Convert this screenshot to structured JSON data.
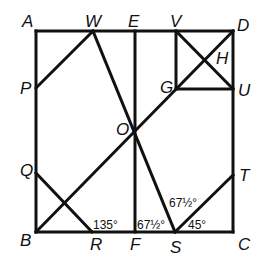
{
  "diagram": {
    "points": {
      "A": {
        "label": "A",
        "x": 36,
        "y": 31
      },
      "B": {
        "label": "B",
        "x": 36,
        "y": 232
      },
      "C": {
        "label": "C",
        "x": 233,
        "y": 232
      },
      "D": {
        "label": "D",
        "x": 233,
        "y": 31
      },
      "W": {
        "label": "W",
        "x": 93,
        "y": 31
      },
      "E": {
        "label": "E",
        "x": 135,
        "y": 31
      },
      "V": {
        "label": "V",
        "x": 176,
        "y": 31
      },
      "P": {
        "label": "P",
        "x": 36,
        "y": 88
      },
      "Q": {
        "label": "Q",
        "x": 36,
        "y": 173
      },
      "O": {
        "label": "O",
        "x": 135,
        "y": 128
      },
      "G": {
        "label": "G",
        "x": 176,
        "y": 89
      },
      "U": {
        "label": "U",
        "x": 233,
        "y": 89
      },
      "H": {
        "label": "H",
        "x": 204,
        "y": 60
      },
      "T": {
        "label": "T",
        "x": 233,
        "y": 175
      },
      "R": {
        "label": "R",
        "x": 92,
        "y": 232
      },
      "F": {
        "label": "F",
        "x": 135,
        "y": 232
      },
      "S": {
        "label": "S",
        "x": 175,
        "y": 232
      }
    },
    "segments": [
      [
        "A",
        "D"
      ],
      [
        "D",
        "C"
      ],
      [
        "C",
        "B"
      ],
      [
        "B",
        "A"
      ],
      [
        "P",
        "W"
      ],
      [
        "W",
        "S"
      ],
      [
        "E",
        "F"
      ],
      [
        "B",
        "D"
      ],
      [
        "V",
        "G"
      ],
      [
        "G",
        "U"
      ],
      [
        "V",
        "U"
      ],
      [
        "Q",
        "R"
      ],
      [
        "S",
        "T"
      ]
    ],
    "angles": [
      {
        "text": "135°",
        "at": "R"
      },
      {
        "text": "67½°",
        "at": "F-S"
      },
      {
        "text": "67½°",
        "at": "S upper"
      },
      {
        "text": "45°",
        "at": "S-C"
      }
    ]
  }
}
